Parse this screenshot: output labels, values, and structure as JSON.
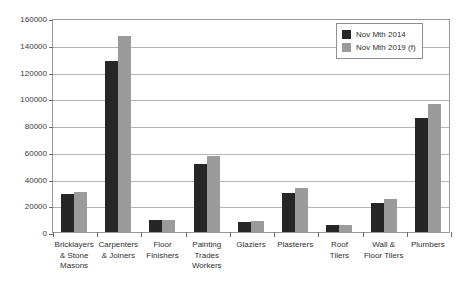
{
  "chart_data": {
    "type": "bar",
    "title": "",
    "subtitle": "",
    "xlabel": "",
    "ylabel": "",
    "ylim": [
      0,
      160000
    ],
    "ytick_step": 20000,
    "yticks": [
      "0",
      "20000",
      "40000",
      "60000",
      "80000",
      "100000",
      "120000",
      "140000",
      "160000"
    ],
    "grid": true,
    "legend_position": "top-right",
    "categories": [
      "Bricklayers\n& Stone\nMasons",
      "Carpenters\n& Joiners",
      "Floor\nFinishers",
      "Painting\nTrades\nWorkers",
      "Glaziers",
      "Plasterers",
      "Roof\nTilers",
      "Wall &\nFloor Tilers",
      "Plumbers"
    ],
    "category_lines": [
      [
        "Bricklayers",
        "& Stone",
        "Masons"
      ],
      [
        "Carpenters",
        "& Joiners"
      ],
      [
        "Floor",
        "Finishers"
      ],
      [
        "Painting",
        "Trades",
        "Workers"
      ],
      [
        "Glaziers"
      ],
      [
        "Plasterers"
      ],
      [
        "Roof",
        "Tilers"
      ],
      [
        "Wall &",
        "Floor Tilers"
      ],
      [
        "Plumbers"
      ]
    ],
    "series": [
      {
        "name": "Nov Mth 2014",
        "color": "#262626",
        "values": [
          28500,
          127500,
          9000,
          51000,
          7500,
          29500,
          5000,
          21500,
          85500
        ]
      },
      {
        "name": "Nov Mth 2019 (f)",
        "color": "#9b9b9b",
        "values": [
          30000,
          146500,
          8800,
          57000,
          8500,
          33000,
          5500,
          24500,
          96000
        ]
      }
    ]
  },
  "legend": {
    "items": [
      {
        "label": "Nov Mth 2014",
        "color": "#262626"
      },
      {
        "label": "Nov Mth 2019 (f)",
        "color": "#9b9b9b"
      }
    ]
  },
  "colors": {
    "series_2014": "#262626",
    "series_2019": "#9b9b9b",
    "gridline": "#b5b5b5",
    "axis": "#9a9a9a",
    "text": "#2f2f2f",
    "background": "#ffffff"
  }
}
